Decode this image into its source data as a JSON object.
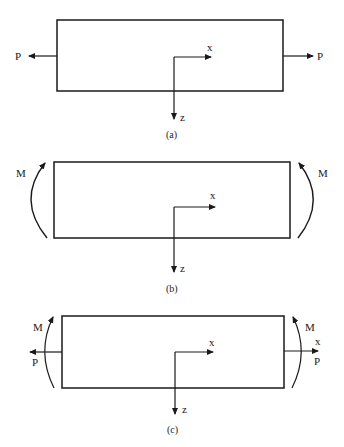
{
  "figure": {
    "panels": [
      {
        "id": "a",
        "caption": "(a)",
        "description": "Bar under axial load",
        "loads": {
          "left_force": "P",
          "right_force": "P"
        },
        "axes": {
          "x_label": "x",
          "z_label": "z"
        }
      },
      {
        "id": "b",
        "caption": "(b)",
        "description": "Bar under end moments",
        "loads": {
          "left_moment": "M",
          "right_moment": "M"
        },
        "axes": {
          "x_label": "x",
          "z_label": "z"
        }
      },
      {
        "id": "c",
        "caption": "(c)",
        "description": "Bar under combined axial force and end moments",
        "loads": {
          "left_moment": "M",
          "left_force": "P",
          "right_moment": "M",
          "right_force": "P",
          "right_axis_label": "x"
        },
        "axes": {
          "x_label": "x",
          "z_label": "z"
        }
      }
    ],
    "colors": {
      "line": "#1a1a1a",
      "background": "#ffffff"
    }
  }
}
